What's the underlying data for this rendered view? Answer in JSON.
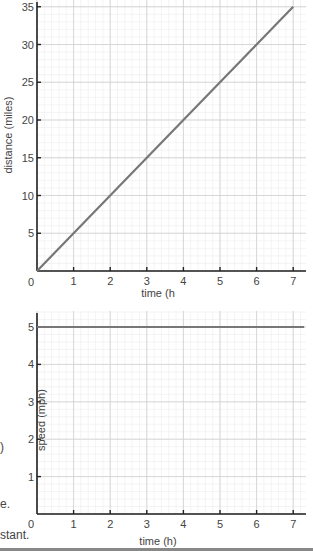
{
  "chart_data": [
    {
      "type": "line",
      "title": "",
      "xlabel": "time (h",
      "ylabel": "distance (miles)",
      "xlim": [
        0,
        7.3
      ],
      "ylim": [
        0,
        36
      ],
      "x_ticks": [
        0,
        1,
        2,
        3,
        4,
        5,
        6,
        7
      ],
      "y_ticks": [
        5,
        10,
        15,
        20,
        25,
        30,
        35
      ],
      "grid": true,
      "series": [
        {
          "name": "distance",
          "x": [
            0,
            1,
            2,
            3,
            4,
            5,
            6,
            7
          ],
          "values": [
            0,
            5,
            10,
            15,
            20,
            25,
            30,
            35
          ]
        }
      ]
    },
    {
      "type": "line",
      "title": "",
      "xlabel": "time (h)",
      "ylabel": "speed (mph)",
      "xlim": [
        0,
        7.3
      ],
      "ylim": [
        0,
        5.1
      ],
      "x_ticks": [
        0,
        1,
        2,
        3,
        4,
        5,
        6,
        7
      ],
      "y_ticks": [
        1,
        2,
        3,
        4,
        5
      ],
      "grid": true,
      "series": [
        {
          "name": "speed",
          "x": [
            0,
            7.3
          ],
          "values": [
            5,
            5
          ]
        }
      ]
    }
  ],
  "margin_text": {
    "paren": ")",
    "e": "e.",
    "stant": "stant."
  },
  "colors": {
    "line": "#777777",
    "axis": "#222222",
    "grid_major": "#cfcfcf",
    "grid_minor": "#ececec"
  }
}
